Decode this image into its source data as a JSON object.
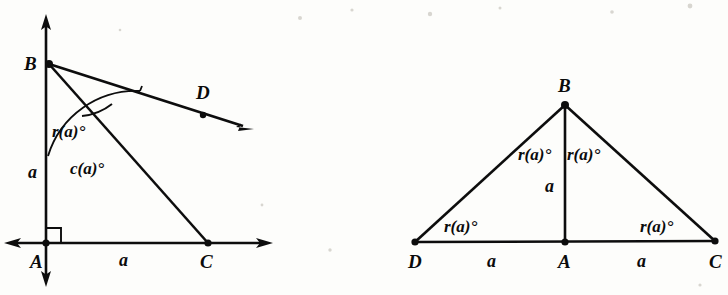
{
  "figure": {
    "background_color": "#fdfdfb",
    "ink_color": "#0d0d0d",
    "panels": [
      {
        "id": "left-panel",
        "name": "right-triangle-with-ray",
        "description": "Coordinate axes with vertical line through A and B; right angle at A; triangle ABC with ray BD",
        "points": [
          {
            "name": "A",
            "label": "A",
            "x": 46,
            "y": 243
          },
          {
            "name": "B",
            "label": "B",
            "x": 49,
            "y": 64
          },
          {
            "name": "C",
            "label": "C",
            "x": 208,
            "y": 243
          },
          {
            "name": "D",
            "label": "D",
            "x": 203,
            "y": 115
          }
        ],
        "point_labels": [
          {
            "name": "A",
            "text": "A",
            "x": 30,
            "y": 268
          },
          {
            "name": "B",
            "text": "B",
            "x": 24,
            "y": 70
          },
          {
            "name": "C",
            "text": "C",
            "x": 200,
            "y": 268
          },
          {
            "name": "D",
            "text": "D",
            "x": 196,
            "y": 99
          }
        ],
        "length_labels": [
          {
            "name": "segment-AB-length",
            "text": "a",
            "x": 28,
            "y": 178
          },
          {
            "name": "segment-AC-length",
            "text": "a",
            "x": 119,
            "y": 266
          }
        ],
        "angle_labels": [
          {
            "name": "angle-DBA",
            "text": "r(a)°",
            "x": 52,
            "y": 137
          },
          {
            "name": "angle-CBA",
            "text": "c(a)°",
            "x": 70,
            "y": 174
          }
        ],
        "markers": [
          {
            "name": "right-angle-at-A",
            "type": "right-angle-square"
          }
        ]
      },
      {
        "id": "right-panel",
        "name": "isosceles-triangle-with-altitude",
        "description": "Isosceles triangle DBC with altitude BA; four equal base-angle labels r(a) degrees",
        "points": [
          {
            "name": "B",
            "label": "B",
            "x": 565,
            "y": 105
          },
          {
            "name": "D",
            "label": "D",
            "x": 415,
            "y": 242
          },
          {
            "name": "A",
            "label": "A",
            "x": 565,
            "y": 242
          },
          {
            "name": "C",
            "label": "C",
            "x": 715,
            "y": 241
          }
        ],
        "point_labels": [
          {
            "name": "B",
            "text": "B",
            "x": 558,
            "y": 92
          },
          {
            "name": "D",
            "text": "D",
            "x": 408,
            "y": 268
          },
          {
            "name": "A",
            "text": "A",
            "x": 558,
            "y": 268
          },
          {
            "name": "C",
            "text": "C",
            "x": 709,
            "y": 268
          }
        ],
        "length_labels": [
          {
            "name": "segment-BA-length",
            "text": "a",
            "x": 545,
            "y": 192
          },
          {
            "name": "segment-DA-length",
            "text": "a",
            "x": 487,
            "y": 267
          },
          {
            "name": "segment-AC-length",
            "text": "a",
            "x": 637,
            "y": 267
          }
        ],
        "angle_labels": [
          {
            "name": "angle-DBA",
            "text": "r(a)°",
            "x": 518,
            "y": 160
          },
          {
            "name": "angle-ABC",
            "text": "r(a)°",
            "x": 567,
            "y": 160
          },
          {
            "name": "angle-BDA",
            "text": "r(a)°",
            "x": 444,
            "y": 232
          },
          {
            "name": "angle-BCA",
            "text": "r(a)°",
            "x": 640,
            "y": 232
          }
        ]
      }
    ],
    "symbols": {
      "degree": "°",
      "variable": "a",
      "function_r": "r(a)°",
      "function_c": "c(a)°"
    }
  }
}
